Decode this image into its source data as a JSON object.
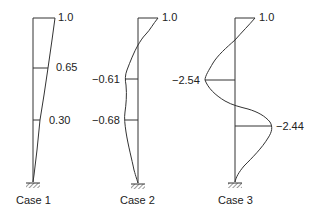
{
  "diagram": {
    "type": "mode-shape-diagrams",
    "stroke_color": "#333333",
    "cases": [
      {
        "label": "Case 1",
        "top_value": "1.0",
        "markers": [
          {
            "value": "0.65"
          },
          {
            "value": "0.30"
          }
        ]
      },
      {
        "label": "Case 2",
        "top_value": "1.0",
        "markers": [
          {
            "value": "−0.61"
          },
          {
            "value": "−0.68"
          }
        ]
      },
      {
        "label": "Case 3",
        "top_value": "1.0",
        "markers": [
          {
            "value": "−2.54"
          },
          {
            "value": "−2.44"
          }
        ]
      }
    ]
  }
}
